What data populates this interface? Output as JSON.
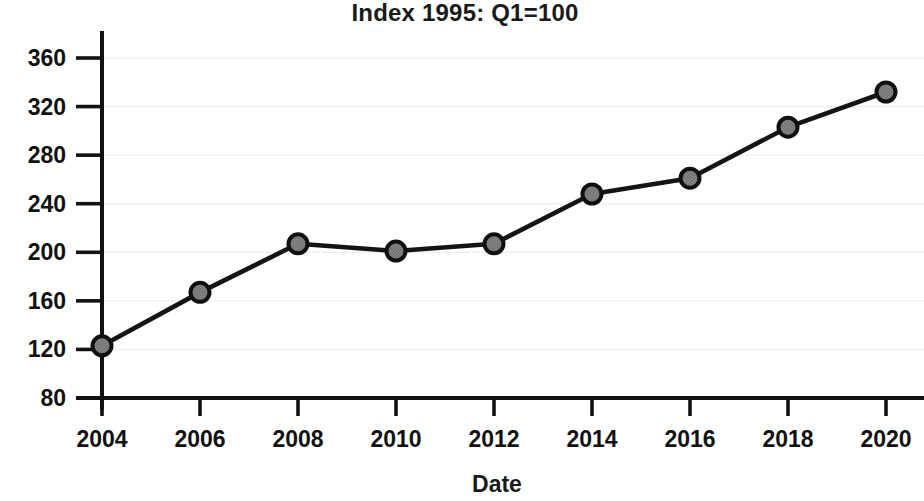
{
  "chart_data": {
    "type": "line",
    "title": "Index 1995: Q1=100",
    "xlabel": "Date",
    "ylabel": "",
    "x": [
      2004,
      2006,
      2008,
      2010,
      2012,
      2014,
      2016,
      2018,
      2020
    ],
    "values": [
      123,
      167,
      207,
      201,
      207,
      248,
      261,
      303,
      332
    ],
    "series": [
      {
        "name": "Index",
        "x": [
          2004,
          2006,
          2008,
          2010,
          2012,
          2014,
          2016,
          2018,
          2020
        ],
        "values": [
          123,
          167,
          207,
          201,
          207,
          248,
          261,
          303,
          332
        ]
      }
    ],
    "xlim": [
      2003.2,
      2020.8
    ],
    "ylim": [
      80,
      375
    ],
    "xticks": [
      2004,
      2006,
      2008,
      2010,
      2012,
      2014,
      2016,
      2018,
      2020
    ],
    "xticklabels": [
      "2004",
      "2006",
      "2008",
      "2010",
      "2012",
      "2014",
      "2016",
      "2018",
      "2020"
    ],
    "yticks": [
      80,
      120,
      160,
      200,
      240,
      280,
      320,
      360
    ],
    "yticklabels": [
      "80",
      "120",
      "160",
      "200",
      "240",
      "280",
      "320",
      "360"
    ],
    "grid": true,
    "grid_axis": "y",
    "legend": false,
    "legend_position": "none",
    "marker": "circle",
    "marker_color": "#6b6b6b",
    "marker_edge_color": "#101010",
    "line_color": "#141414",
    "grid_color": "#f0f0f0",
    "axis_color": "#111111",
    "background_color": "#ffffff"
  },
  "labels": {
    "title": "Index 1995: Q1=100",
    "xaxis_title": "Date"
  }
}
